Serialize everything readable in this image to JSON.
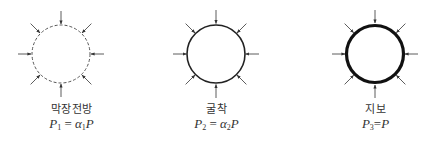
{
  "figure": {
    "panels": [
      {
        "id": "face-front",
        "label": "막장전방",
        "equation": {
          "lhs_symbol": "P",
          "lhs_subscript": "1",
          "operator": "=",
          "coef_symbol": "α",
          "coef_subscript": "1",
          "rhs_symbol": "P"
        },
        "circle": {
          "cx": 61,
          "cy": 54,
          "r": 29,
          "stroke_style": "dashed",
          "stroke_width": 1,
          "stroke_color": "#555555"
        },
        "arrow_count": 8
      },
      {
        "id": "excavation",
        "label": "굴착",
        "equation": {
          "lhs_symbol": "P",
          "lhs_subscript": "2",
          "operator": "=",
          "coef_symbol": "α",
          "coef_subscript": "2",
          "rhs_symbol": "P"
        },
        "circle": {
          "cx": 216,
          "cy": 54,
          "r": 29,
          "stroke_style": "solid",
          "stroke_width": 1.6,
          "stroke_color": "#222222"
        },
        "arrow_count": 8
      },
      {
        "id": "support",
        "label": "지보",
        "equation": {
          "lhs_symbol": "P",
          "lhs_subscript": "3",
          "operator": "=",
          "coef_symbol": "",
          "coef_subscript": "",
          "rhs_symbol": "P"
        },
        "circle": {
          "cx": 375,
          "cy": 54,
          "r": 29,
          "stroke_style": "solid-thick",
          "stroke_width": 3.2,
          "stroke_color": "#111111"
        },
        "arrow_count": 8
      }
    ],
    "arrow_color": "#333333",
    "arrow_length": 13
  }
}
